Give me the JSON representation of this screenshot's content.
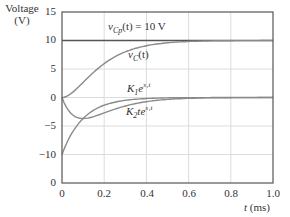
{
  "chart_data": {
    "type": "line",
    "title": "",
    "ylabel": "Voltage (V)",
    "ylabel_line1": "Voltage",
    "ylabel_line2": "(V)",
    "xlabel": "t (ms)",
    "xlim": [
      0,
      1.0
    ],
    "ylim": [
      -15,
      15
    ],
    "grid": true,
    "yticks": [
      15,
      10,
      5,
      0,
      -5,
      -10,
      -15
    ],
    "ytick_labels": [
      "15",
      "10",
      "5",
      "0",
      "−5",
      "−10",
      "0"
    ],
    "xticks": [
      0,
      0.2,
      0.4,
      0.6,
      0.8,
      1.0
    ],
    "xtick_labels": [
      "0",
      "0.2",
      "0.4",
      "0.6",
      "0.8",
      "1.0"
    ],
    "x": [
      0,
      0.05,
      0.1,
      0.15,
      0.2,
      0.25,
      0.3,
      0.4,
      0.5,
      0.6,
      0.7,
      0.8,
      0.9,
      1.0
    ],
    "series": [
      {
        "name": "vCp(t) = 10 V",
        "label_main": "v",
        "label_sub": "Cp",
        "label_rest": "(t) = 10 V",
        "color": "#555555",
        "values": [
          10,
          10,
          10,
          10,
          10,
          10,
          10,
          10,
          10,
          10,
          10,
          10,
          10,
          10
        ]
      },
      {
        "name": "vC(t)",
        "label_main": "v",
        "label_sub": "C",
        "label_rest": "(t)",
        "color": "#8a8a8a",
        "values": [
          0,
          0.9,
          2.64,
          4.42,
          5.94,
          7.13,
          8.01,
          9.08,
          9.6,
          9.83,
          9.93,
          9.98,
          9.99,
          10
        ]
      },
      {
        "name": "K1 e^(s1 t)",
        "label_main": "K",
        "label_sub": "1",
        "label_rest": "e",
        "label_sup": "s₁t",
        "color": "#8a8a8a",
        "values": [
          -10,
          -6.07,
          -3.68,
          -2.23,
          -1.35,
          -0.82,
          -0.5,
          -0.18,
          -0.07,
          -0.02,
          -0.01,
          0,
          0,
          0
        ]
      },
      {
        "name": "K2 t e^(s1 t)",
        "label_main": "K",
        "label_sub": "2",
        "label_rest": "te",
        "label_sup": "s₁t",
        "color": "#8a8a8a",
        "values": [
          0,
          -3.03,
          -3.68,
          -3.35,
          -2.71,
          -2.05,
          -1.49,
          -0.73,
          -0.34,
          -0.15,
          -0.06,
          -0.02,
          -0.01,
          0
        ]
      }
    ],
    "annotations": [
      {
        "text": "vCp(t) = 10 V",
        "x": 0.21,
        "y": 11.6
      },
      {
        "text": "vC(t)",
        "x": 0.32,
        "y": 7.1
      },
      {
        "text": "K1 e^(s1 t)",
        "x": 0.32,
        "y": 1.4
      },
      {
        "text": "K2 t e^(s1 t)",
        "x": 0.32,
        "y": -2.6
      }
    ],
    "style": {
      "frame_color": "#555555",
      "grid_color": "#dcdcdc",
      "zero_line_color": "#666666"
    }
  }
}
